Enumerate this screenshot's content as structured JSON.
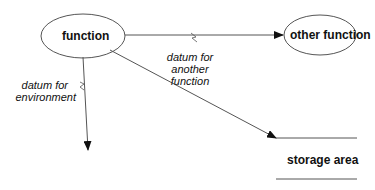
{
  "diagram": {
    "nodes": {
      "function": {
        "label": "function",
        "shape": "ellipse"
      },
      "other_function": {
        "label": "other function",
        "shape": "ellipse"
      },
      "storage": {
        "label": "storage area",
        "shape": "data-store"
      }
    },
    "flows": {
      "to_other": {
        "line1": "datum for",
        "line2": "another",
        "line3": "function",
        "icon": "lightning-icon"
      },
      "to_env": {
        "line1": "datum for",
        "line2": "environment",
        "icon": "lightning-icon"
      },
      "to_storage": {
        "label": ""
      }
    },
    "colors": {
      "stroke": "#555555",
      "text": "#111111",
      "background": "#ffffff"
    }
  }
}
